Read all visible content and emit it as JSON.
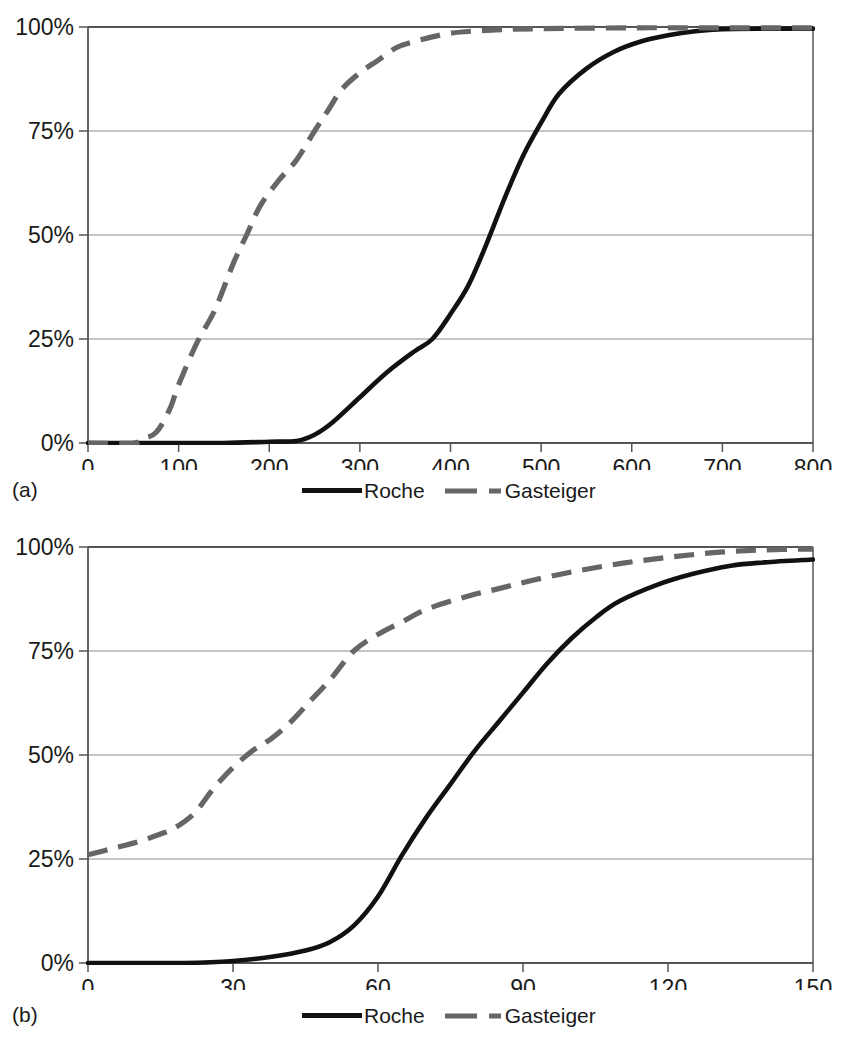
{
  "figure": {
    "panels": [
      {
        "id": "a",
        "caption": "(a)",
        "legend": [
          {
            "label": "Roche",
            "style": "solid",
            "color": "#111111"
          },
          {
            "label": "Gasteiger",
            "style": "dashed",
            "color": "#666666"
          }
        ]
      },
      {
        "id": "b",
        "caption": "(b)",
        "legend": [
          {
            "label": "Roche",
            "style": "solid",
            "color": "#111111"
          },
          {
            "label": "Gasteiger",
            "style": "dashed",
            "color": "#666666"
          }
        ]
      }
    ]
  },
  "chart_data": [
    {
      "type": "line",
      "panel": "(a)",
      "title": "",
      "xlabel": "",
      "ylabel": "",
      "xlim": [
        0,
        800
      ],
      "ylim": [
        0,
        100
      ],
      "xticks": [
        0,
        100,
        200,
        300,
        400,
        500,
        600,
        700,
        800
      ],
      "xticklabels": [
        "0",
        "100",
        "200",
        "300",
        "400",
        "500",
        "600",
        "700",
        "800"
      ],
      "yticks": [
        0,
        25,
        50,
        75,
        100
      ],
      "yticklabels": [
        "0%",
        "25%",
        "50%",
        "75%",
        "100%"
      ],
      "grid": "horizontal",
      "legend_position": "bottom-center",
      "series": [
        {
          "name": "Roche",
          "style": "solid",
          "color": "#111111",
          "x": [
            0,
            50,
            100,
            150,
            200,
            230,
            250,
            270,
            300,
            330,
            360,
            380,
            400,
            420,
            440,
            460,
            480,
            500,
            520,
            550,
            580,
            610,
            640,
            670,
            700,
            750,
            800
          ],
          "y": [
            0,
            0,
            0,
            0,
            0.3,
            0.5,
            2,
            5,
            11,
            17,
            22,
            25,
            31,
            38,
            48,
            59,
            69,
            77,
            84,
            90,
            94,
            96.5,
            98,
            99,
            99.5,
            99.6,
            99.6
          ]
        },
        {
          "name": "Gasteiger",
          "style": "dashed",
          "color": "#666666",
          "x": [
            0,
            50,
            60,
            75,
            90,
            100,
            120,
            140,
            160,
            175,
            190,
            210,
            230,
            250,
            265,
            280,
            300,
            320,
            340,
            360,
            400,
            450,
            500,
            600,
            700,
            800
          ],
          "y": [
            0,
            0,
            1,
            2.5,
            8,
            14,
            24,
            32,
            43,
            50,
            57,
            63,
            68,
            75,
            80,
            85,
            89,
            92,
            95,
            96.5,
            98.5,
            99.3,
            99.6,
            99.8,
            99.8,
            99.8
          ]
        }
      ]
    },
    {
      "type": "line",
      "panel": "(b)",
      "title": "",
      "xlabel": "",
      "ylabel": "",
      "xlim": [
        0,
        150
      ],
      "ylim": [
        0,
        100
      ],
      "xticks": [
        0,
        30,
        60,
        90,
        120,
        150
      ],
      "xticklabels": [
        "0",
        "30",
        "60",
        "90",
        "120",
        "150"
      ],
      "yticks": [
        0,
        25,
        50,
        75,
        100
      ],
      "yticklabels": [
        "0%",
        "25%",
        "50%",
        "75%",
        "100%"
      ],
      "grid": "horizontal",
      "legend_position": "bottom-center",
      "series": [
        {
          "name": "Roche",
          "style": "solid",
          "color": "#111111",
          "x": [
            0,
            10,
            20,
            30,
            38,
            45,
            50,
            55,
            60,
            65,
            70,
            75,
            80,
            85,
            90,
            95,
            100,
            105,
            110,
            118,
            125,
            133,
            140,
            150
          ],
          "y": [
            0,
            0,
            0,
            0.5,
            1.5,
            3,
            5,
            9,
            16,
            26,
            35,
            43,
            51,
            58,
            65,
            72,
            78,
            83,
            87,
            91,
            93.5,
            95.5,
            96.3,
            97
          ]
        },
        {
          "name": "Gasteiger",
          "style": "dashed",
          "color": "#666666",
          "x": [
            0,
            5,
            10,
            15,
            18,
            22,
            26,
            30,
            34,
            38,
            42,
            46,
            50,
            55,
            60,
            65,
            70,
            78,
            85,
            92,
            100,
            110,
            120,
            130,
            140,
            150
          ],
          "y": [
            26,
            27.5,
            29,
            31,
            32.5,
            36,
            42,
            47,
            51,
            54,
            58,
            63,
            68,
            75,
            79,
            82,
            85,
            88,
            90,
            92,
            94,
            96,
            97.5,
            98.7,
            99.3,
            99.5
          ]
        }
      ]
    }
  ]
}
